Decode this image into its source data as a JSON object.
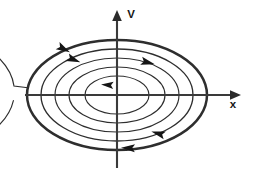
{
  "figure": {
    "background_color": "#ffffff",
    "stroke_color": "#2e2e2e",
    "axis_color": "#3a3a3a"
  },
  "axes": {
    "vertical": {
      "label": "V",
      "label_x": 131,
      "label_y": 18,
      "x": 117,
      "y_top": 12,
      "y_bottom": 168,
      "arrow_at": "top"
    },
    "horizontal": {
      "label": "x",
      "label_x": 233,
      "label_y": 108,
      "y": 95,
      "x_left": 25,
      "x_right": 240,
      "arrow_at": "right"
    },
    "origin": {
      "x": 117,
      "y": 95
    }
  },
  "chart_data": {
    "type": "line",
    "xlabel": "x",
    "ylabel": "V",
    "grid": false,
    "legend": false,
    "origin": {
      "x": 117,
      "y": 95
    },
    "flow_direction": "clockwise",
    "orbits": [
      {
        "name": "orbit-1-inner",
        "rx": 32,
        "ry": 19,
        "cx": 117,
        "cy": 95,
        "weight": "thin",
        "closed": true
      },
      {
        "name": "orbit-2",
        "rx": 48,
        "ry": 28,
        "cx": 117,
        "cy": 95,
        "weight": "thin",
        "closed": true
      },
      {
        "name": "orbit-3",
        "rx": 62,
        "ry": 37,
        "cx": 117,
        "cy": 95,
        "weight": "thin",
        "closed": true
      },
      {
        "name": "orbit-4",
        "rx": 76,
        "ry": 46,
        "cx": 117,
        "cy": 95,
        "weight": "med",
        "closed": true
      },
      {
        "name": "orbit-5-bold",
        "rx": 90,
        "ry": 55,
        "cx": 117,
        "cy": 95,
        "weight": "bold",
        "closed": true
      },
      {
        "name": "orbit-6-outer",
        "rx": 104,
        "ry": 64,
        "cx": 117,
        "cy": 95,
        "weight": "thin",
        "closed": false
      }
    ],
    "arrows": [
      {
        "name": "arrow-outer-upper-left",
        "x": 62,
        "y": 48,
        "angle": 28,
        "size": 9
      },
      {
        "name": "arrow-bold-upper-left",
        "x": 72,
        "y": 59,
        "angle": 22,
        "size": 9
      },
      {
        "name": "arrow-upper-right",
        "x": 146,
        "y": 62,
        "angle": 14,
        "size": 9
      },
      {
        "name": "arrow-inner-center-left",
        "x": 109,
        "y": 85,
        "angle": 184,
        "size": 8
      },
      {
        "name": "arrow-lower-right",
        "x": 160,
        "y": 134,
        "angle": 196,
        "size": 9
      },
      {
        "name": "arrow-lower-left",
        "x": 130,
        "y": 148,
        "angle": 182,
        "size": 9
      }
    ]
  }
}
